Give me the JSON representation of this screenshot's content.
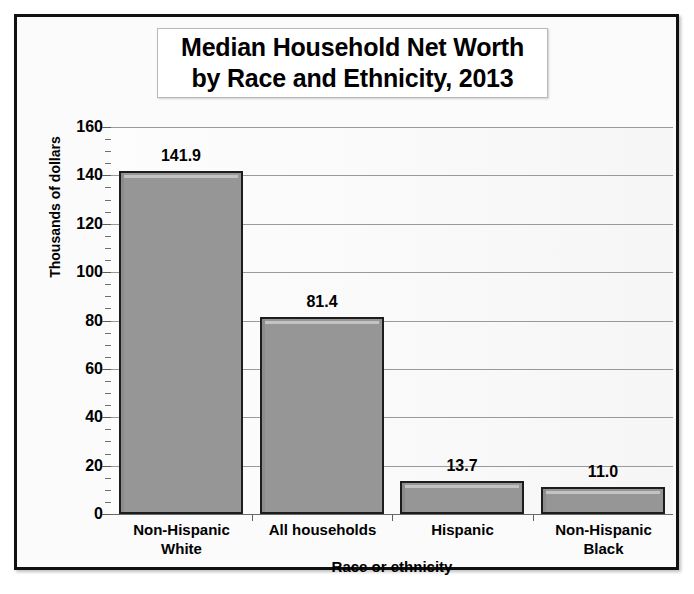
{
  "chart_data": {
    "type": "bar",
    "title": "Median Household Net Worth by Race and Ethnicity, 2013",
    "title_lines": [
      "Median Household Net Worth",
      "by Race and Ethnicity, 2013"
    ],
    "categories": [
      "Non-Hispanic White",
      "All households",
      "Hispanic",
      "Non-Hispanic Black"
    ],
    "category_lines": [
      [
        "Non-Hispanic",
        "White"
      ],
      [
        "All households",
        ""
      ],
      [
        "Hispanic",
        ""
      ],
      [
        "Non-Hispanic",
        "Black"
      ]
    ],
    "values": [
      141.9,
      81.4,
      13.7,
      11.0
    ],
    "value_labels": [
      "141.9",
      "81.4",
      "13.7",
      "11.0"
    ],
    "xlabel": "Race or ethnicity",
    "ylabel": "Thousands of dollars",
    "ylim": [
      0,
      160
    ],
    "ytick_values": [
      0,
      20,
      40,
      60,
      80,
      100,
      120,
      140,
      160
    ],
    "ytick_labels": [
      "0",
      "20",
      "40",
      "60",
      "80",
      "100",
      "120",
      "140",
      "160"
    ],
    "y_minor_tick_interval": 5,
    "grid": true,
    "grid_axis": "y",
    "legend": null,
    "legend_position": "none",
    "colors": {
      "bar_fill": "#969696",
      "bar_border": "#1d1d1d",
      "bar_highlight": "#c3c3c3",
      "gridline": "#9a9a9a",
      "axis": "#5e5e5e",
      "plot_background": "#fbfbfb",
      "frame": "#111111",
      "text": "#000000"
    }
  }
}
